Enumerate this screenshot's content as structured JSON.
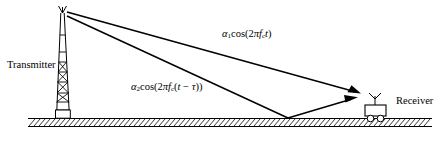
{
  "figure": {
    "type": "two-ray-multipath-propagation-diagram",
    "transmitter_label": "Transmitter",
    "receiver_label": "Receiver",
    "direct_path": {
      "label_plain": "α1cos(2πfct)",
      "alpha": "α",
      "alpha_sub": "1",
      "cos_open": "cos(2",
      "pi": "π",
      "freq": "f",
      "freq_sub": "c",
      "time": "t",
      "close": ")"
    },
    "reflected_path": {
      "label_plain": "α2cos(2πfc(t − τ))",
      "alpha": "α",
      "alpha_sub": "2",
      "cos_open": "cos(2",
      "pi": "π",
      "freq": "f",
      "freq_sub": "c",
      "inner_open": "(",
      "time": "t",
      "minus": " − ",
      "tau": "τ",
      "close": "))"
    },
    "colors": {
      "stroke": "#000000",
      "background": "#ffffff",
      "ground_fill": "#ffffff"
    }
  }
}
